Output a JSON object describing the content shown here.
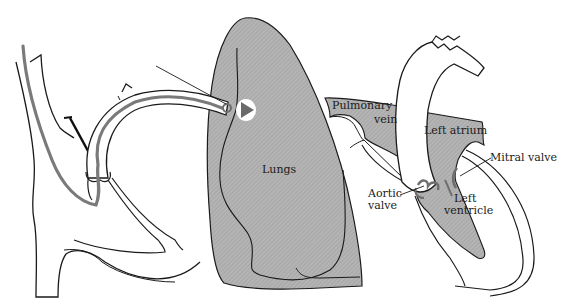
{
  "diagram": {
    "type": "anatomical-illustration",
    "colors": {
      "background": "#ffffff",
      "tissue_fill": "#a9a9a9",
      "outline": "#1a1a1a",
      "catheter": "#7a7a7a",
      "valve": "#6e6e6e"
    },
    "labels": {
      "lungs": "Lungs",
      "pulmonary_vein_line1": "Pulmonary",
      "pulmonary_vein_line2": "vein",
      "left_atrium": "Left atrium",
      "mitral_valve": "Mitral valve",
      "aortic_valve_line1": "Aortic",
      "aortic_valve_line2": "valve",
      "left_ventricle_line1": "Left",
      "left_ventricle_line2": "ventricle"
    }
  }
}
